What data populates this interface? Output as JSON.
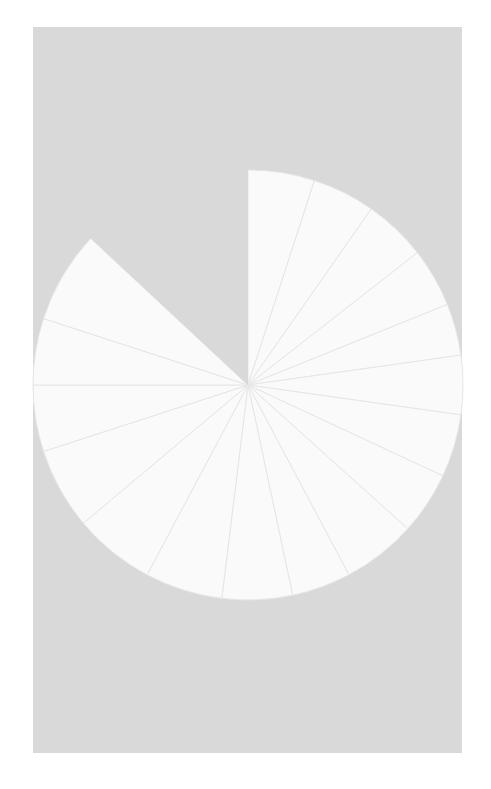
{
  "figure": {
    "width": 491,
    "height": 789,
    "facecolor": "#ffffff",
    "axes_facecolor": "#d9d9d9",
    "axes_rect": {
      "x": 33,
      "y": 27,
      "width": 429,
      "height": 726
    }
  },
  "chart_data": {
    "type": "pie",
    "title": "",
    "subtitle": "",
    "xlabel": "",
    "ylabel": "",
    "legend": [],
    "legend_position": "none",
    "grid": false,
    "labels_shown": false,
    "autopct_shown": false,
    "center": {
      "x": 248,
      "y": 385
    },
    "radius": 215,
    "startangle": 90,
    "direction": "counterclockwise",
    "slice_facecolor": "#fafafa",
    "slice_edgecolor": "#e6e6e6",
    "slice_edgewidth": 1,
    "gap_facecolor": "#d9d9d9",
    "total_degrees": 360,
    "categories": [
      "s1",
      "s2",
      "s3",
      "s4",
      "s5",
      "s6",
      "s7",
      "s8",
      "s9",
      "s10",
      "s11",
      "s12",
      "s13",
      "s14",
      "s15",
      "s16",
      "s17",
      "s18"
    ],
    "values": [
      18,
      17,
      17,
      16,
      14,
      16,
      17,
      17,
      20,
      16,
      19,
      21,
      22,
      22,
      18,
      18,
      25,
      47
    ],
    "slice_angles_deg": [
      18,
      17,
      17,
      16,
      14,
      16,
      17,
      17,
      20,
      16,
      19,
      21,
      22,
      22,
      18,
      18,
      25,
      47
    ],
    "slice_boundaries_deg": [
      90,
      72,
      55,
      38,
      22,
      8,
      -8,
      -25,
      -42,
      -62,
      -78,
      -97,
      -118,
      -140,
      -162,
      180,
      162,
      137,
      90
    ],
    "slices": [
      {
        "name": "slice-01",
        "start_deg": 90,
        "end_deg": 72,
        "sweep_deg": 18,
        "visible": true
      },
      {
        "name": "slice-02",
        "start_deg": 72,
        "end_deg": 55,
        "sweep_deg": 17,
        "visible": true
      },
      {
        "name": "slice-03",
        "start_deg": 55,
        "end_deg": 38,
        "sweep_deg": 17,
        "visible": true
      },
      {
        "name": "slice-04",
        "start_deg": 38,
        "end_deg": 22,
        "sweep_deg": 16,
        "visible": true
      },
      {
        "name": "slice-05",
        "start_deg": 22,
        "end_deg": 8,
        "sweep_deg": 14,
        "visible": true
      },
      {
        "name": "slice-06",
        "start_deg": 8,
        "end_deg": -8,
        "sweep_deg": 16,
        "visible": true
      },
      {
        "name": "slice-07",
        "start_deg": -8,
        "end_deg": -25,
        "sweep_deg": 17,
        "visible": true
      },
      {
        "name": "slice-08",
        "start_deg": -25,
        "end_deg": -42,
        "sweep_deg": 17,
        "visible": true
      },
      {
        "name": "slice-09",
        "start_deg": -42,
        "end_deg": -62,
        "sweep_deg": 20,
        "visible": true
      },
      {
        "name": "slice-10",
        "start_deg": -62,
        "end_deg": -78,
        "sweep_deg": 16,
        "visible": true
      },
      {
        "name": "slice-11",
        "start_deg": -78,
        "end_deg": -97,
        "sweep_deg": 19,
        "visible": true
      },
      {
        "name": "slice-12",
        "start_deg": -97,
        "end_deg": -118,
        "sweep_deg": 21,
        "visible": true
      },
      {
        "name": "slice-13",
        "start_deg": -118,
        "end_deg": -140,
        "sweep_deg": 22,
        "visible": true
      },
      {
        "name": "slice-14",
        "start_deg": -140,
        "end_deg": -162,
        "sweep_deg": 22,
        "visible": true
      },
      {
        "name": "slice-15",
        "start_deg": -162,
        "end_deg": -180,
        "sweep_deg": 18,
        "visible": true
      },
      {
        "name": "slice-16",
        "start_deg": 180,
        "end_deg": 162,
        "sweep_deg": 18,
        "visible": true
      },
      {
        "name": "slice-17",
        "start_deg": 162,
        "end_deg": 137,
        "sweep_deg": 25,
        "visible": true
      },
      {
        "name": "slice-18",
        "start_deg": 137,
        "end_deg": 90,
        "sweep_deg": 47,
        "visible": false
      }
    ]
  }
}
